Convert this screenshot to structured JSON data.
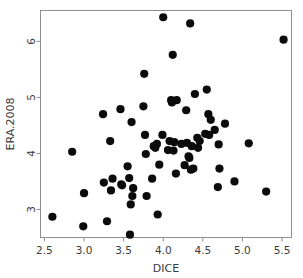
{
  "chart_data": {
    "type": "scatter",
    "title": "",
    "subtitle": "",
    "xlabel": "DICE",
    "ylabel": "ERA.2008",
    "xlim": [
      2.45,
      5.62
    ],
    "ylim": [
      2.5,
      6.55
    ],
    "xticks": [
      2.5,
      3.0,
      3.5,
      4.0,
      4.5,
      5.0,
      5.5
    ],
    "xticklabels": [
      "2.5",
      "3.0",
      "3.5",
      "4.0",
      "4.5",
      "5.0",
      "5.5"
    ],
    "yticks": [
      3,
      4,
      5,
      6
    ],
    "yticklabels": [
      "3",
      "4",
      "5",
      "6"
    ],
    "grid": false,
    "legend": null,
    "legend_position": "none",
    "marker": "filled-circle",
    "marker_color": "#0b0b0b",
    "marker_size": 4.1,
    "frame_color": "#8d8d8d",
    "background_color": "#ffffff",
    "n_points": 69,
    "x": [
      2.6,
      2.85,
      2.99,
      3.0,
      3.24,
      3.25,
      3.29,
      3.33,
      3.34,
      3.36,
      3.46,
      3.47,
      3.48,
      3.55,
      3.57,
      3.58,
      3.59,
      3.6,
      3.61,
      3.62,
      3.75,
      3.76,
      3.77,
      3.78,
      3.79,
      3.86,
      3.88,
      3.9,
      3.92,
      3.93,
      3.95,
      3.99,
      4.0,
      4.06,
      4.08,
      4.1,
      4.11,
      4.12,
      4.13,
      4.14,
      4.16,
      4.17,
      4.23,
      4.27,
      4.29,
      4.3,
      4.32,
      4.33,
      4.34,
      4.35,
      4.36,
      4.38,
      4.4,
      4.43,
      4.44,
      4.46,
      4.53,
      4.55,
      4.57,
      4.58,
      4.6,
      4.65,
      4.69,
      4.7,
      4.71,
      4.78,
      4.9,
      5.08,
      5.3,
      5.52
    ],
    "y": [
      2.87,
      4.03,
      2.7,
      3.29,
      4.7,
      3.48,
      2.79,
      4.22,
      3.34,
      3.55,
      4.79,
      3.45,
      3.43,
      3.77,
      3.56,
      2.55,
      3.09,
      4.56,
      3.24,
      3.38,
      4.84,
      5.42,
      4.33,
      3.99,
      3.24,
      3.55,
      4.13,
      4.1,
      4.17,
      2.91,
      3.8,
      4.33,
      6.43,
      4.06,
      4.22,
      4.95,
      4.91,
      5.76,
      4.05,
      4.2,
      3.64,
      4.95,
      4.17,
      3.79,
      4.77,
      4.19,
      3.95,
      3.92,
      6.32,
      3.71,
      4.13,
      3.73,
      5.06,
      4.28,
      4.1,
      4.22,
      4.35,
      5.14,
      4.7,
      4.33,
      4.6,
      4.42,
      3.4,
      4.16,
      3.73,
      4.53,
      3.5,
      4.18,
      3.32,
      6.03
    ]
  }
}
